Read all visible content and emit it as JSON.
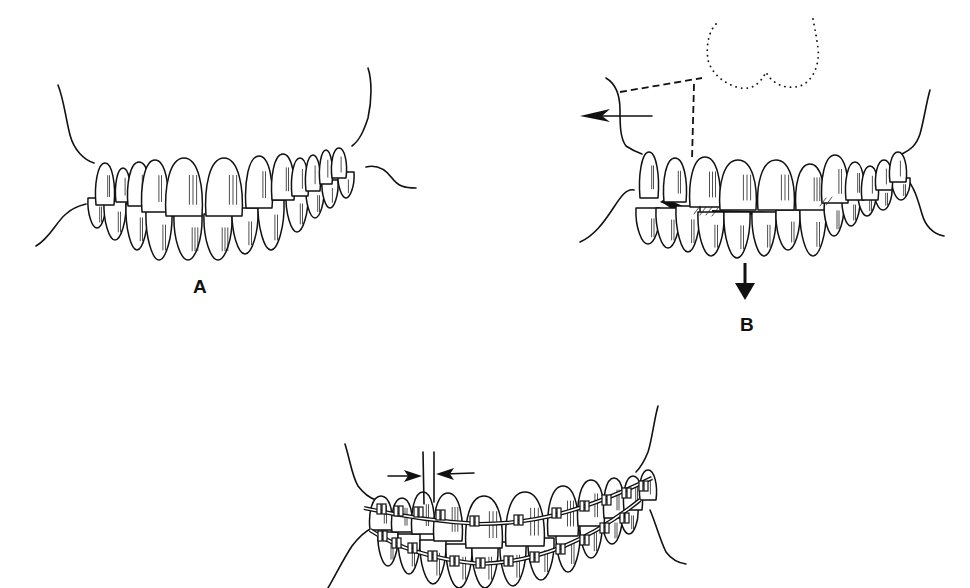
{
  "figure": {
    "ink_color": "#111111",
    "background": "#ffffff",
    "panels": [
      {
        "id": "A",
        "label": "A",
        "label_pos": [
          196,
          293
        ],
        "content": "Anterior dentition in occlusion, normal overbite",
        "upper_teeth": [
          {
            "x": 96,
            "y": 163,
            "w": 18,
            "h": 42
          },
          {
            "x": 116,
            "y": 168,
            "w": 14,
            "h": 34
          },
          {
            "x": 128,
            "y": 162,
            "w": 22,
            "h": 44
          },
          {
            "x": 142,
            "y": 160,
            "w": 26,
            "h": 52
          },
          {
            "x": 166,
            "y": 158,
            "w": 36,
            "h": 58
          },
          {
            "x": 206,
            "y": 158,
            "w": 36,
            "h": 58
          },
          {
            "x": 246,
            "y": 156,
            "w": 26,
            "h": 52
          },
          {
            "x": 272,
            "y": 154,
            "w": 22,
            "h": 46
          },
          {
            "x": 292,
            "y": 158,
            "w": 16,
            "h": 38
          },
          {
            "x": 306,
            "y": 155,
            "w": 14,
            "h": 36
          },
          {
            "x": 320,
            "y": 150,
            "w": 12,
            "h": 34
          },
          {
            "x": 332,
            "y": 148,
            "w": 14,
            "h": 30
          }
        ],
        "lower_teeth": [
          {
            "x": 88,
            "y": 198,
            "w": 18,
            "h": 30
          },
          {
            "x": 104,
            "y": 200,
            "w": 22,
            "h": 40
          },
          {
            "x": 126,
            "y": 204,
            "w": 22,
            "h": 46
          },
          {
            "x": 146,
            "y": 210,
            "w": 26,
            "h": 50
          },
          {
            "x": 174,
            "y": 214,
            "w": 28,
            "h": 46
          },
          {
            "x": 204,
            "y": 214,
            "w": 28,
            "h": 46
          },
          {
            "x": 232,
            "y": 208,
            "w": 26,
            "h": 46
          },
          {
            "x": 258,
            "y": 200,
            "w": 26,
            "h": 50
          },
          {
            "x": 286,
            "y": 192,
            "w": 22,
            "h": 40
          },
          {
            "x": 306,
            "y": 186,
            "w": 18,
            "h": 32
          },
          {
            "x": 322,
            "y": 180,
            "w": 16,
            "h": 28
          },
          {
            "x": 338,
            "y": 172,
            "w": 16,
            "h": 26
          }
        ]
      },
      {
        "id": "B",
        "label": "B",
        "label_pos": [
          745,
          322
        ],
        "content": "Deep bite with spacing; outline of lip (dotted), reference lines (dashed), forward arrow and downward arrow",
        "arrows": [
          {
            "direction": "left",
            "from": [
              652,
              114
            ],
            "to": [
              580,
              114
            ]
          },
          {
            "direction": "down",
            "from": [
              745,
              265
            ],
            "to": [
              745,
              300
            ]
          }
        ],
        "upper_teeth": [
          {
            "x": 640,
            "y": 152,
            "w": 18,
            "h": 46
          },
          {
            "x": 664,
            "y": 158,
            "w": 22,
            "h": 44
          },
          {
            "x": 690,
            "y": 157,
            "w": 30,
            "h": 50
          },
          {
            "x": 720,
            "y": 160,
            "w": 36,
            "h": 50
          },
          {
            "x": 758,
            "y": 160,
            "w": 36,
            "h": 50
          },
          {
            "x": 796,
            "y": 164,
            "w": 28,
            "h": 46
          },
          {
            "x": 822,
            "y": 155,
            "w": 26,
            "h": 48
          },
          {
            "x": 846,
            "y": 162,
            "w": 18,
            "h": 38
          },
          {
            "x": 862,
            "y": 166,
            "w": 16,
            "h": 34
          },
          {
            "x": 876,
            "y": 160,
            "w": 16,
            "h": 30
          },
          {
            "x": 890,
            "y": 152,
            "w": 16,
            "h": 30
          }
        ],
        "lower_teeth": [
          {
            "x": 636,
            "y": 208,
            "w": 24,
            "h": 36
          },
          {
            "x": 656,
            "y": 208,
            "w": 24,
            "h": 40
          },
          {
            "x": 676,
            "y": 206,
            "w": 24,
            "h": 46
          },
          {
            "x": 698,
            "y": 212,
            "w": 26,
            "h": 44
          },
          {
            "x": 724,
            "y": 212,
            "w": 26,
            "h": 46
          },
          {
            "x": 752,
            "y": 212,
            "w": 24,
            "h": 44
          },
          {
            "x": 776,
            "y": 210,
            "w": 24,
            "h": 40
          },
          {
            "x": 800,
            "y": 208,
            "w": 26,
            "h": 48
          },
          {
            "x": 824,
            "y": 200,
            "w": 20,
            "h": 36
          },
          {
            "x": 842,
            "y": 196,
            "w": 18,
            "h": 30
          },
          {
            "x": 858,
            "y": 190,
            "w": 18,
            "h": 26
          },
          {
            "x": 874,
            "y": 186,
            "w": 18,
            "h": 24
          },
          {
            "x": 892,
            "y": 178,
            "w": 18,
            "h": 22
          }
        ]
      },
      {
        "id": "C",
        "label": "",
        "content": "Fixed orthodontic appliance (brackets and archwires) with arrows indicating closure of a space",
        "space_arrows": [
          {
            "direction": "right",
            "from": [
              387,
              474
            ],
            "to": [
              421,
              474
            ]
          },
          {
            "direction": "left",
            "from": [
              474,
              472
            ],
            "to": [
              436,
              472
            ]
          }
        ],
        "upper_teeth": [
          {
            "x": 370,
            "y": 496,
            "w": 22,
            "h": 34
          },
          {
            "x": 392,
            "y": 498,
            "w": 20,
            "h": 34
          },
          {
            "x": 412,
            "y": 492,
            "w": 22,
            "h": 42
          },
          {
            "x": 434,
            "y": 493,
            "w": 28,
            "h": 48
          },
          {
            "x": 466,
            "y": 496,
            "w": 36,
            "h": 52
          },
          {
            "x": 506,
            "y": 492,
            "w": 38,
            "h": 54
          },
          {
            "x": 548,
            "y": 486,
            "w": 30,
            "h": 50
          },
          {
            "x": 578,
            "y": 480,
            "w": 26,
            "h": 46
          },
          {
            "x": 604,
            "y": 478,
            "w": 20,
            "h": 40
          },
          {
            "x": 624,
            "y": 476,
            "w": 18,
            "h": 34
          },
          {
            "x": 640,
            "y": 470,
            "w": 16,
            "h": 30
          }
        ],
        "lower_teeth": [
          {
            "x": 378,
            "y": 532,
            "w": 20,
            "h": 34
          },
          {
            "x": 398,
            "y": 534,
            "w": 22,
            "h": 40
          },
          {
            "x": 420,
            "y": 540,
            "w": 26,
            "h": 44
          },
          {
            "x": 446,
            "y": 544,
            "w": 26,
            "h": 44
          },
          {
            "x": 472,
            "y": 544,
            "w": 26,
            "h": 44
          },
          {
            "x": 500,
            "y": 542,
            "w": 26,
            "h": 44
          },
          {
            "x": 528,
            "y": 538,
            "w": 26,
            "h": 42
          },
          {
            "x": 556,
            "y": 530,
            "w": 24,
            "h": 42
          },
          {
            "x": 580,
            "y": 522,
            "w": 22,
            "h": 36
          },
          {
            "x": 602,
            "y": 514,
            "w": 20,
            "h": 30
          },
          {
            "x": 620,
            "y": 508,
            "w": 18,
            "h": 26
          }
        ],
        "upper_brackets": [
          [
            381,
            509
          ],
          [
            398,
            511
          ],
          [
            418,
            512
          ],
          [
            440,
            515
          ],
          [
            474,
            521
          ],
          [
            518,
            520
          ],
          [
            556,
            513
          ],
          [
            584,
            506
          ],
          [
            606,
            500
          ],
          [
            626,
            493
          ],
          [
            643,
            486
          ]
        ],
        "lower_brackets": [
          [
            382,
            536
          ],
          [
            396,
            543
          ],
          [
            412,
            548
          ],
          [
            432,
            556
          ],
          [
            454,
            561
          ],
          [
            480,
            563
          ],
          [
            508,
            561
          ],
          [
            534,
            557
          ],
          [
            560,
            549
          ],
          [
            584,
            540
          ],
          [
            604,
            528
          ],
          [
            624,
            518
          ]
        ]
      }
    ]
  }
}
